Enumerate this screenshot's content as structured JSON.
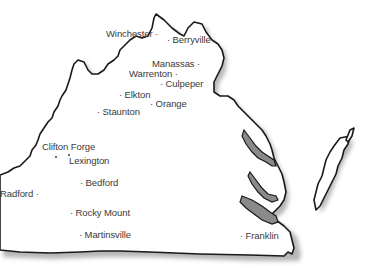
{
  "map": {
    "region": "Virginia",
    "style": {
      "land_fill": "#ffffff",
      "outline_color": "#1a1a1a",
      "shadow_color": "#7a7a7a",
      "water_fill": "#8a8a8a",
      "label_color": "#3a3a3a"
    },
    "cities": [
      {
        "id": "winchester",
        "label": "Winchester ·"
      },
      {
        "id": "berryville",
        "label": "· Berryville"
      },
      {
        "id": "manassas",
        "label": "Manassas ·"
      },
      {
        "id": "warrenton",
        "label": "Warrenton ·"
      },
      {
        "id": "culpeper",
        "label": "· Culpeper"
      },
      {
        "id": "elkton",
        "label": "· Elkton"
      },
      {
        "id": "orange",
        "label": "· Orange"
      },
      {
        "id": "staunton",
        "label": "· Staunton"
      },
      {
        "id": "clifton_forge",
        "label": "Clifton Forge"
      },
      {
        "id": "lexington",
        "label": "Lexington"
      },
      {
        "id": "bedford",
        "label": "· Bedford"
      },
      {
        "id": "radford",
        "label": "Radford ·"
      },
      {
        "id": "rocky_mount",
        "label": "· Rocky Mount"
      },
      {
        "id": "martinsville",
        "label": "· Martinsville"
      },
      {
        "id": "franklin",
        "label": "· Franklin"
      }
    ]
  }
}
